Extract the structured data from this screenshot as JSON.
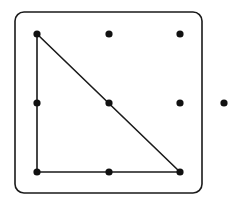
{
  "diagram": {
    "type": "geoboard",
    "board": {
      "x": 15,
      "y": 12,
      "width": 187,
      "height": 181,
      "corner_radius": 9
    },
    "grid": {
      "columns_x": [
        37,
        109,
        180
      ],
      "rows_y": [
        34,
        103,
        172
      ]
    },
    "dots": [
      {
        "x": 37,
        "y": 34
      },
      {
        "x": 109,
        "y": 34
      },
      {
        "x": 180,
        "y": 34
      },
      {
        "x": 37,
        "y": 103
      },
      {
        "x": 109,
        "y": 103
      },
      {
        "x": 180,
        "y": 103
      },
      {
        "x": 37,
        "y": 172
      },
      {
        "x": 109,
        "y": 172
      },
      {
        "x": 180,
        "y": 172
      }
    ],
    "outside_dot": {
      "x": 224,
      "y": 103
    },
    "triangle": {
      "label": "right triangle",
      "vertices": [
        {
          "x": 37,
          "y": 34
        },
        {
          "x": 37,
          "y": 172
        },
        {
          "x": 180,
          "y": 172
        }
      ]
    },
    "colors": {
      "stroke": "#1a1a1a",
      "dot": "#111111",
      "background": "#ffffff"
    }
  }
}
